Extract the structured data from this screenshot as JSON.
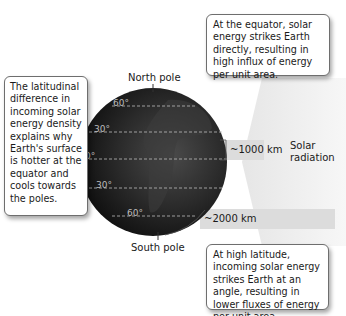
{
  "callouts": {
    "equator": "At the equator, solar energy strikes Earth directly, resulting in high influx of energy per unit area.",
    "latitudinal": "The latitudinal difference in incoming solar energy density explains why Earth's surface is hotter at the equator and cools towards the poles.",
    "high_latitude": "At high latitude, incoming solar energy strikes Earth at an angle, resulting in lower fluxes of energy per unit area."
  },
  "labels": {
    "north_pole": "North pole",
    "south_pole": "South pole",
    "solar_radiation": "Solar radiation",
    "equator_band": "~1000 km",
    "high_lat_band": "~2000 km"
  },
  "latitudes": {
    "n60": "60°",
    "n30": "30°",
    "eq": "0°",
    "s30": "30°",
    "s60": "60°"
  },
  "colors": {
    "band": "#d9d9d9",
    "arrow": "#ebebeb",
    "globe_dark": "#1b1b1b",
    "callout_border": "#6e6e6e"
  }
}
